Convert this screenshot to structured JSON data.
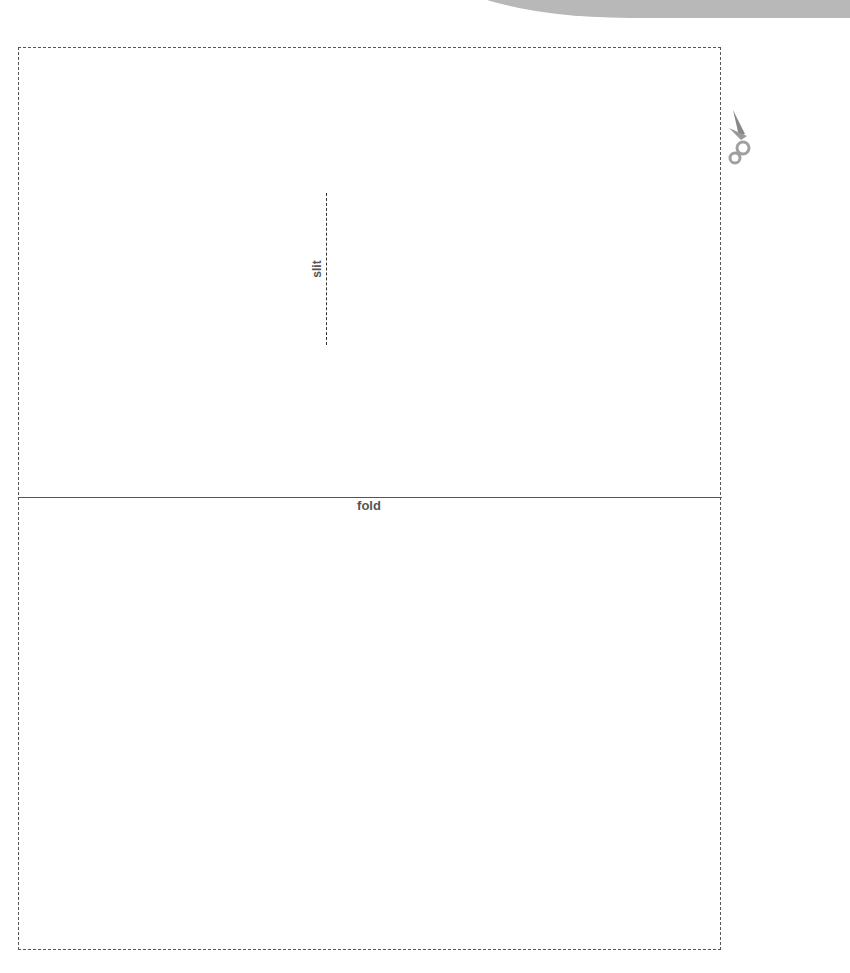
{
  "header": {
    "banner_text": "PHOTOCOPIABLE",
    "banner_color": "#b8b8b8"
  },
  "template": {
    "fold_label": "fold",
    "slit_label": "slit",
    "line_color": "#555555"
  },
  "icons": {
    "scissors": "scissors-icon"
  }
}
